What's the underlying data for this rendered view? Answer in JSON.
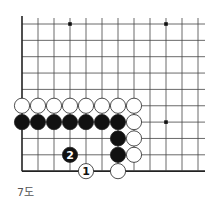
{
  "diagram": {
    "caption": "7도",
    "grid": {
      "origin_x": 22,
      "origin_y": 24,
      "spacing_x": 16,
      "spacing_y": 16.35,
      "cols": 12,
      "rows": 10,
      "right_end": 205,
      "left_edge": true,
      "bottom_edge": true,
      "line_color": "#444",
      "edge_color": "#222"
    },
    "star_points": [
      [
        3,
        0
      ],
      [
        9,
        0
      ],
      [
        9,
        6
      ]
    ],
    "stones": [
      {
        "col": 0,
        "row": 5,
        "color": "white"
      },
      {
        "col": 1,
        "row": 5,
        "color": "white"
      },
      {
        "col": 2,
        "row": 5,
        "color": "white"
      },
      {
        "col": 3,
        "row": 5,
        "color": "white"
      },
      {
        "col": 4,
        "row": 5,
        "color": "white"
      },
      {
        "col": 5,
        "row": 5,
        "color": "white"
      },
      {
        "col": 6,
        "row": 5,
        "color": "white"
      },
      {
        "col": 7,
        "row": 5,
        "color": "white"
      },
      {
        "col": 0,
        "row": 6,
        "color": "black"
      },
      {
        "col": 1,
        "row": 6,
        "color": "black"
      },
      {
        "col": 2,
        "row": 6,
        "color": "black"
      },
      {
        "col": 3,
        "row": 6,
        "color": "black"
      },
      {
        "col": 4,
        "row": 6,
        "color": "black"
      },
      {
        "col": 5,
        "row": 6,
        "color": "black"
      },
      {
        "col": 6,
        "row": 6,
        "color": "black"
      },
      {
        "col": 7,
        "row": 6,
        "color": "white"
      },
      {
        "col": 6,
        "row": 7,
        "color": "black"
      },
      {
        "col": 7,
        "row": 7,
        "color": "white"
      },
      {
        "col": 6,
        "row": 8,
        "color": "black"
      },
      {
        "col": 7,
        "row": 8,
        "color": "white"
      },
      {
        "col": 3,
        "row": 8,
        "color": "black",
        "label": "2"
      },
      {
        "col": 4,
        "row": 9,
        "color": "white",
        "label": "1"
      },
      {
        "col": 6,
        "row": 9,
        "color": "white"
      }
    ]
  }
}
